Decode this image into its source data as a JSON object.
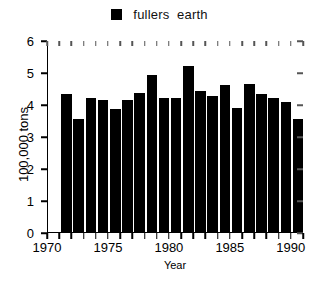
{
  "chart_data": {
    "type": "bar",
    "title": "",
    "legend": [
      "fullers  earth"
    ],
    "legend_position": "top-center",
    "xlabel": "Year",
    "ylabel": "100,000  tons",
    "grid": false,
    "xlim": [
      1970,
      1991
    ],
    "ylim": [
      0,
      6
    ],
    "ytick_labels": [
      "0",
      "1",
      "2",
      "3",
      "4",
      "5",
      "6"
    ],
    "ytick_values": [
      0,
      1,
      2,
      3,
      4,
      5,
      6
    ],
    "xtick_labels": [
      "1970",
      "1975",
      "1980",
      "1985",
      "1990"
    ],
    "xtick_values": [
      1970,
      1975,
      1980,
      1985,
      1990
    ],
    "xtick_minor_values": [
      1971,
      1972,
      1973,
      1974,
      1976,
      1977,
      1978,
      1979,
      1981,
      1982,
      1983,
      1984,
      1986,
      1987,
      1988,
      1989,
      1991
    ],
    "bar_color": "#000000",
    "categories": [
      1971,
      1972,
      1973,
      1974,
      1975,
      1976,
      1977,
      1978,
      1979,
      1980,
      1981,
      1982,
      1983,
      1984,
      1985,
      1986,
      1987,
      1988,
      1989,
      1990
    ],
    "values": [
      4.32,
      3.54,
      4.19,
      4.12,
      3.85,
      4.13,
      4.34,
      4.92,
      4.18,
      4.18,
      5.18,
      4.42,
      4.24,
      4.59,
      3.88,
      4.63,
      4.32,
      4.19,
      4.05,
      3.52
    ],
    "series": [
      {
        "name": "fullers  earth",
        "values": [
          4.32,
          3.54,
          4.19,
          4.12,
          3.85,
          4.13,
          4.34,
          4.92,
          4.18,
          4.18,
          5.18,
          4.42,
          4.24,
          4.59,
          3.88,
          4.63,
          4.32,
          4.19,
          4.05,
          3.52
        ]
      }
    ]
  },
  "legend": {
    "label": "fullers  earth",
    "swatch_color": "#000000"
  },
  "axes": {
    "ylabel": "100,000  tons",
    "xlabel": "Year"
  },
  "caption": ""
}
